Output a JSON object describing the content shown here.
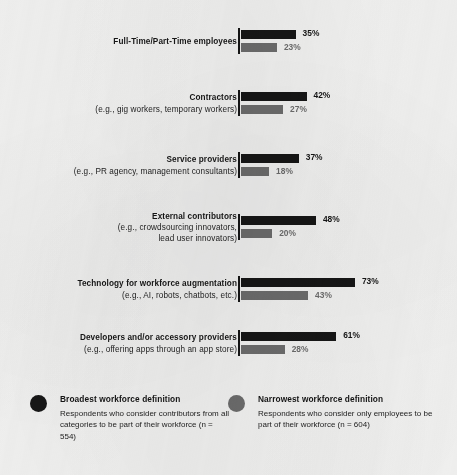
{
  "chart_data": {
    "type": "bar",
    "orientation": "horizontal",
    "title": "",
    "xlabel": "",
    "ylabel": "",
    "xlim": [
      0,
      100
    ],
    "grid": false,
    "legend_position": "bottom",
    "value_suffix": "%",
    "categories": [
      "Full-Time/Part-Time employees",
      "Contractors",
      "Service providers",
      "External contributors",
      "Technology for workforce augmentation",
      "Developers and/or accessory providers"
    ],
    "series": [
      {
        "name": "Broadest workforce definition",
        "color": "#161616",
        "values": [
          35,
          42,
          37,
          48,
          73,
          61
        ],
        "labels": [
          "35%",
          "42%",
          "37%",
          "48%",
          "73%",
          "61%"
        ]
      },
      {
        "name": "Narrowest workforce definition",
        "color": "#6c6c6c",
        "values": [
          23,
          27,
          18,
          20,
          43,
          28
        ],
        "labels": [
          "23%",
          "27%",
          "18%",
          "20%",
          "43%",
          "28%"
        ]
      }
    ]
  },
  "rows": [
    {
      "label_main": "Full-Time/Part-Time employees",
      "label_sub": "",
      "label_sub2": "",
      "broad_value": "35%",
      "narrow_value": "23%",
      "broad_pct": 35,
      "narrow_pct": 23
    },
    {
      "label_main": "Contractors",
      "label_sub": "(e.g., gig workers, temporary workers)",
      "label_sub2": "",
      "broad_value": "42%",
      "narrow_value": "27%",
      "broad_pct": 42,
      "narrow_pct": 27
    },
    {
      "label_main": "Service providers",
      "label_sub": "(e.g., PR agency, management consultants)",
      "label_sub2": "",
      "broad_value": "37%",
      "narrow_value": "18%",
      "broad_pct": 37,
      "narrow_pct": 18
    },
    {
      "label_main": "External contributors",
      "label_sub": "(e.g., crowdsourcing innovators,",
      "label_sub2": "lead user innovators)",
      "broad_value": "48%",
      "narrow_value": "20%",
      "broad_pct": 48,
      "narrow_pct": 20
    },
    {
      "label_main": "Technology for workforce augmentation",
      "label_sub": "(e.g., AI, robots, chatbots, etc.)",
      "label_sub2": "",
      "broad_value": "73%",
      "narrow_value": "43%",
      "broad_pct": 73,
      "narrow_pct": 43
    },
    {
      "label_main": "Developers and/or accessory providers",
      "label_sub": "(e.g., offering apps through an app store)",
      "label_sub2": "",
      "broad_value": "61%",
      "narrow_value": "28%",
      "broad_pct": 61,
      "narrow_pct": 28
    }
  ],
  "legend": {
    "broad": {
      "title": "Broadest workforce definition",
      "description": "Respondents who consider contributors from all categories to be part of their workforce (n = 554)"
    },
    "narrow": {
      "title": "Narrowest workforce definition",
      "description": "Respondents who consider only employees to be part of their workforce (n = 604)"
    }
  },
  "colors": {
    "broad": "#161616",
    "narrow": "#6c6c6c",
    "background": "#f1f1f0",
    "axis": "#151515"
  }
}
